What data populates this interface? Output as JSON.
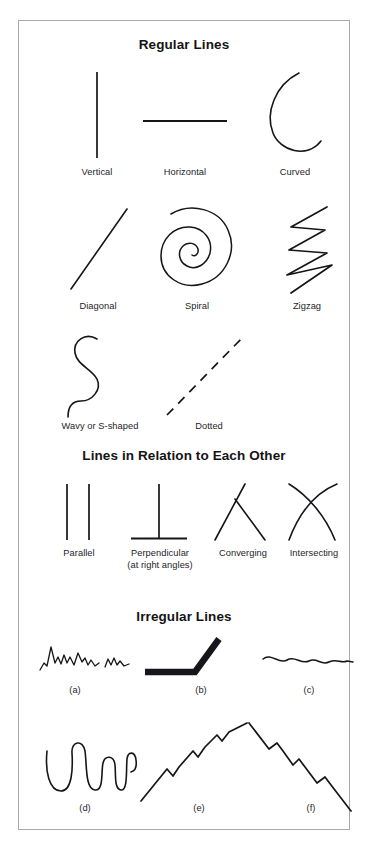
{
  "page": {
    "background_color": "#ffffff",
    "border_color": "#a9a9ad",
    "ink_color": "#15151a"
  },
  "sections": [
    {
      "id": "regular-lines",
      "heading": "Regular Lines",
      "items": [
        {
          "id": "vertical",
          "caption": "Vertical"
        },
        {
          "id": "horizontal",
          "caption": "Horizontal"
        },
        {
          "id": "curved",
          "caption": "Curved"
        },
        {
          "id": "diagonal",
          "caption": "Diagonal"
        },
        {
          "id": "spiral",
          "caption": "Spiral"
        },
        {
          "id": "zigzag",
          "caption": "Zigzag"
        },
        {
          "id": "wavy",
          "caption": "Wavy or S-shaped"
        },
        {
          "id": "dotted",
          "caption": "Dotted"
        }
      ]
    },
    {
      "id": "lines-in-relation",
      "heading": "Lines in Relation to Each Other",
      "items": [
        {
          "id": "parallel",
          "caption": "Parallel"
        },
        {
          "id": "perpendicular",
          "caption": "Perpendicular",
          "caption_line2": "(at right angles)"
        },
        {
          "id": "converging",
          "caption": "Converging"
        },
        {
          "id": "intersecting",
          "caption": "Intersecting"
        }
      ]
    },
    {
      "id": "irregular-lines",
      "heading": "Irregular Lines",
      "items": [
        {
          "id": "irregular-a",
          "caption": "(a)"
        },
        {
          "id": "irregular-b",
          "caption": "(b)"
        },
        {
          "id": "irregular-c",
          "caption": "(c)"
        },
        {
          "id": "irregular-d",
          "caption": "(d)"
        },
        {
          "id": "irregular-e",
          "caption": "(e)"
        },
        {
          "id": "irregular-f",
          "caption": "(f)"
        }
      ]
    }
  ]
}
